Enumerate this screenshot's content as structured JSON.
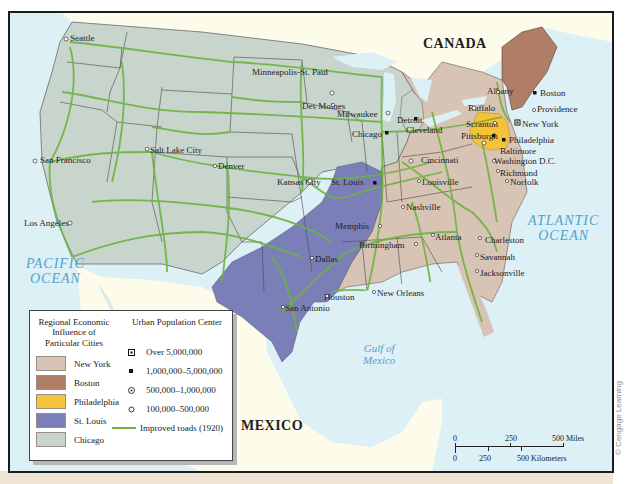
{
  "map": {
    "countries": {
      "canada": "CANADA",
      "mexico": "MEXICO"
    },
    "water_bodies": {
      "pacific_line1": "PACIFIC",
      "pacific_line2": "OCEAN",
      "atlantic_line1": "ATLANTIC",
      "atlantic_line2": "OCEAN",
      "gulf_line1": "Gulf of",
      "gulf_line2": "Mexico"
    },
    "cities": [
      {
        "name": "Seattle",
        "symbol": "500k-1m"
      },
      {
        "name": "San Francisco",
        "symbol": "500k-1m"
      },
      {
        "name": "Los Angeles",
        "symbol": "500k-1m"
      },
      {
        "name": "Salt Lake City",
        "symbol": "100k-500k"
      },
      {
        "name": "Denver",
        "symbol": "100k-500k"
      },
      {
        "name": "Minneapolis-St. Paul",
        "symbol": "500k-1m"
      },
      {
        "name": "Des Moines",
        "symbol": "100k-500k"
      },
      {
        "name": "Kansas City",
        "symbol": "500k-1m"
      },
      {
        "name": "Milwaukee",
        "symbol": "500k-1m"
      },
      {
        "name": "Chicago",
        "symbol": "1m-5m"
      },
      {
        "name": "St. Louis",
        "symbol": "1m-5m"
      },
      {
        "name": "Detroit",
        "symbol": "1m-5m"
      },
      {
        "name": "Cleveland",
        "symbol": "500k-1m"
      },
      {
        "name": "Cincinnati",
        "symbol": "500k-1m"
      },
      {
        "name": "Louisville",
        "symbol": "100k-500k"
      },
      {
        "name": "Nashville",
        "symbol": "100k-500k"
      },
      {
        "name": "Memphis",
        "symbol": "100k-500k"
      },
      {
        "name": "Birmingham",
        "symbol": "100k-500k"
      },
      {
        "name": "Atlanta",
        "symbol": "100k-500k"
      },
      {
        "name": "Dallas",
        "symbol": "100k-500k"
      },
      {
        "name": "Houston",
        "symbol": "100k-500k"
      },
      {
        "name": "San Antonio",
        "symbol": "100k-500k"
      },
      {
        "name": "New Orleans",
        "symbol": "100k-500k"
      },
      {
        "name": "Charleston",
        "symbol": "100k-500k"
      },
      {
        "name": "Savannah",
        "symbol": "100k-500k"
      },
      {
        "name": "Jacksonville",
        "symbol": "100k-500k"
      },
      {
        "name": "Albany",
        "symbol": "100k-500k"
      },
      {
        "name": "Boston",
        "symbol": "1m-5m"
      },
      {
        "name": "Providence",
        "symbol": "100k-500k"
      },
      {
        "name": "Buffalo",
        "symbol": "500k-1m"
      },
      {
        "name": "Scranton",
        "symbol": "100k-500k"
      },
      {
        "name": "New York",
        "symbol": "over-5m"
      },
      {
        "name": "Pittsburgh",
        "symbol": "1m-5m"
      },
      {
        "name": "Philadelphia",
        "symbol": "1m-5m"
      },
      {
        "name": "Baltimore",
        "symbol": "500k-1m"
      },
      {
        "name": "Washington D.C.",
        "symbol": "100k-500k"
      },
      {
        "name": "Richmond",
        "symbol": "100k-500k"
      },
      {
        "name": "Norfolk",
        "symbol": "100k-500k"
      }
    ]
  },
  "legend": {
    "regions_title": "Regional Economic Influence of Particular Cities",
    "regions": [
      {
        "label": "New York",
        "color": "#d8c4b4"
      },
      {
        "label": "Boston",
        "color": "#b07e66"
      },
      {
        "label": "Philadelphia",
        "color": "#f4c33a"
      },
      {
        "label": "St. Louis",
        "color": "#7b7fb8"
      },
      {
        "label": "Chicago",
        "color": "#c7d5cd"
      }
    ],
    "population_title": "Urban Population Center",
    "population": [
      {
        "label": "Over 5,000,000",
        "symbol": "square-dot"
      },
      {
        "label": "1,000,000–5,000,000",
        "symbol": "small-square"
      },
      {
        "label": "500,000–1,000,000",
        "symbol": "circle-dot"
      },
      {
        "label": "100,000–500,000",
        "symbol": "open-circle"
      }
    ],
    "roads_label": "Improved roads (1920)",
    "road_color": "#6db33f"
  },
  "scale": {
    "miles_ticks": [
      "0",
      "250",
      "500 Miles"
    ],
    "km_ticks": [
      "0",
      "250",
      "500 Kilometers"
    ]
  },
  "credit": "© Cengage Learning"
}
